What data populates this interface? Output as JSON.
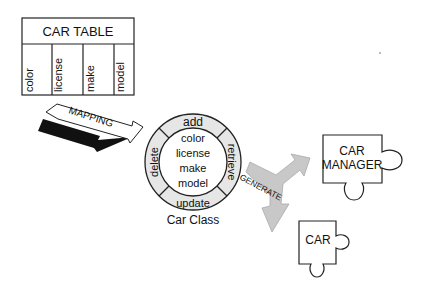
{
  "car_table": {
    "title": "CAR TABLE",
    "columns": [
      "color",
      "license",
      "make",
      "model"
    ]
  },
  "mapping_arrow": {
    "label": "MAPPING"
  },
  "car_class": {
    "caption": "Car Class",
    "attributes": [
      "color",
      "license",
      "make",
      "model"
    ],
    "methods": {
      "top": "add",
      "right": "retrieve",
      "bottom": "update",
      "left": "delete"
    }
  },
  "generate_arrow": {
    "label": "GENERATE"
  },
  "outputs": {
    "manager": {
      "line1": "CAR",
      "line2": "MANAGER"
    },
    "car": {
      "label": "CAR"
    }
  },
  "colors": {
    "ring_fill": "#e6e6e6",
    "arrow_fill": "#c8c8c8",
    "arrow_shadow": "#111111",
    "stroke": "#222222"
  }
}
